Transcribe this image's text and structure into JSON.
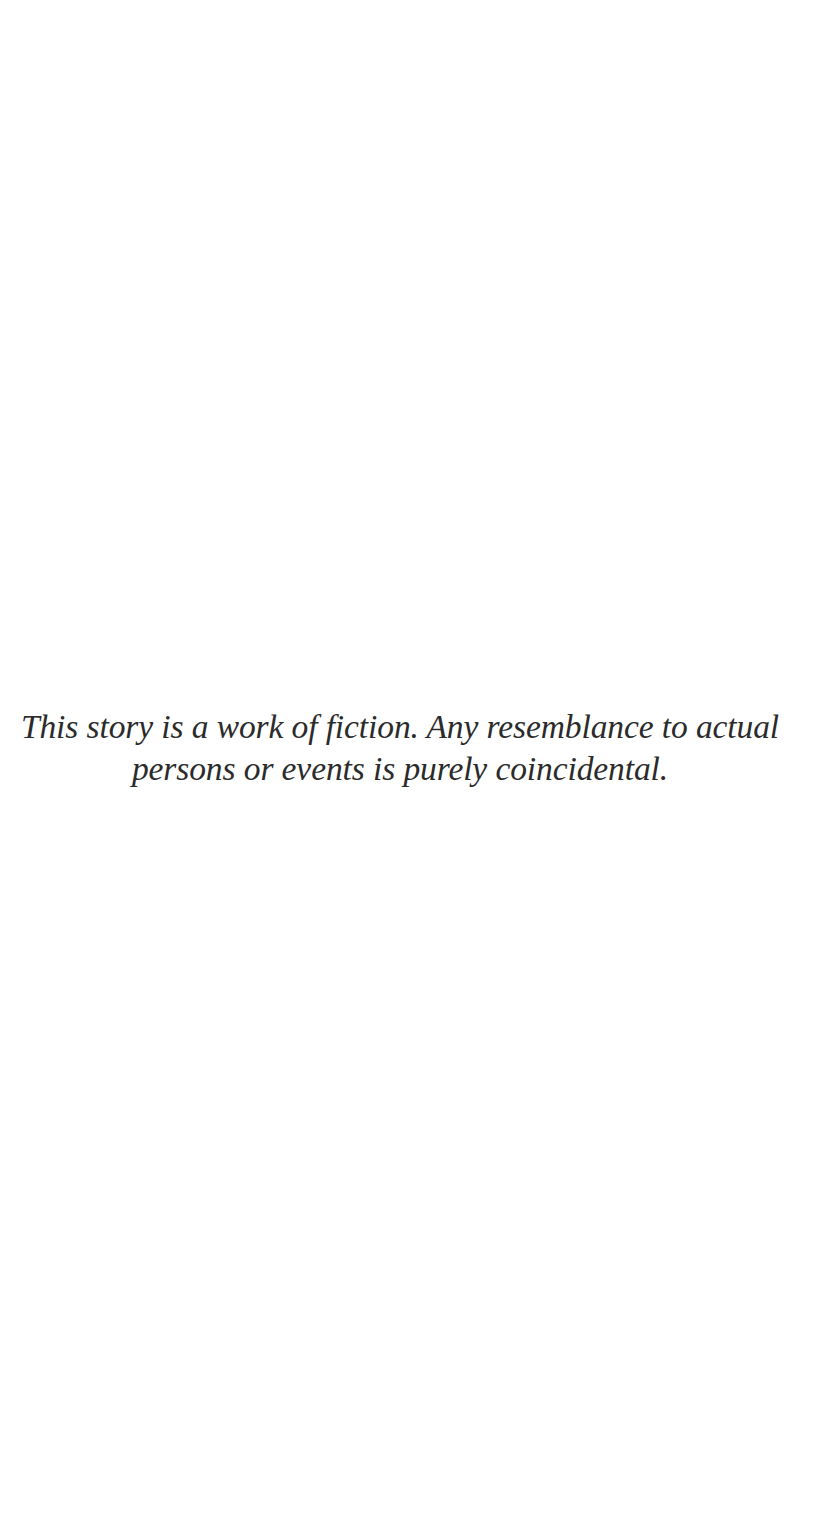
{
  "page": {
    "background_color": "#ffffff",
    "width": 835,
    "height": 1534
  },
  "disclaimer": {
    "full_text": "This story is a work of fiction. Any resemblance to actual persons or events is purely coincidental.",
    "lines": [
      "This story is a work of fiction. Any resemblance to",
      "actual persons or events is purely coincidental."
    ],
    "line_1": "This story is a work of fiction. Any resemblance to",
    "line_2": "actual persons or events is purely coincidental.",
    "text_color": "#2b2b2b",
    "style": "italic-serif",
    "alignment": "center"
  }
}
